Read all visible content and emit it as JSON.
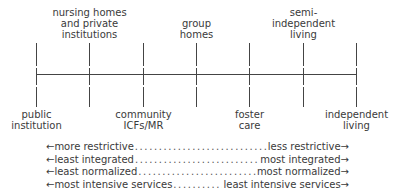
{
  "diagram": {
    "type": "continuum",
    "ticks": [
      {
        "label": "public\ninstitution",
        "position": "below"
      },
      {
        "label": "nursing homes\nand private\ninstitutions",
        "position": "above"
      },
      {
        "label": "community\nICFs/MR",
        "position": "below"
      },
      {
        "label": "group\nhomes",
        "position": "above"
      },
      {
        "label": "foster\ncare",
        "position": "below"
      },
      {
        "label": "semi-\nindependent\nliving",
        "position": "above"
      },
      {
        "label": "independent\nliving",
        "position": "below"
      }
    ],
    "legend": [
      {
        "left": "←more restrictive",
        "right": "less restrictive→"
      },
      {
        "left": "←least integrated",
        "right": "most integrated→"
      },
      {
        "left": "←least normalized",
        "right": "most normalized→"
      },
      {
        "left": "←most intensive services",
        "right": "least intensive services→"
      }
    ],
    "colors": {
      "ink": "#3a3a3a",
      "line": "#444444",
      "background": "#ffffff"
    }
  }
}
